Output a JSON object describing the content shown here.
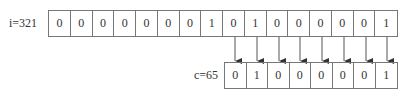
{
  "top": {
    "label": "i=321",
    "bits": [
      "0",
      "0",
      "0",
      "0",
      "0",
      "0",
      "0",
      "1",
      "0",
      "1",
      "0",
      "0",
      "0",
      "0",
      "0",
      "1"
    ]
  },
  "bottom": {
    "label": "c=65",
    "bits": [
      "0",
      "1",
      "0",
      "0",
      "0",
      "0",
      "0",
      "1"
    ]
  },
  "arrow_count": 8
}
